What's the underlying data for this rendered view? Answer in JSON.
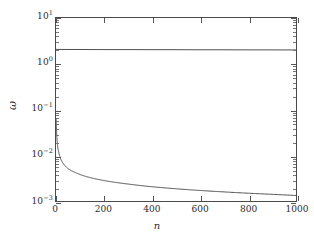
{
  "chart_data": {
    "type": "line",
    "title": "",
    "xlabel": "n",
    "ylabel": "ω",
    "xlim": [
      0,
      1000
    ],
    "ylim": [
      0.001,
      10
    ],
    "yscale": "log",
    "xscale": "linear",
    "grid": false,
    "legend": null,
    "xticks": [
      0,
      200,
      400,
      600,
      800,
      1000
    ],
    "xtick_labels": [
      "0",
      "200",
      "400",
      "600",
      "800",
      "1000"
    ],
    "yticks": [
      10,
      1,
      0.1,
      0.01,
      0.001
    ],
    "ytick_labels": [
      "10¹",
      "10⁰",
      "10⁻¹",
      "10⁻²",
      "10⁻³"
    ],
    "ytick_mantissas": [
      "10",
      "10",
      "10",
      "10",
      "10"
    ],
    "ytick_exponents": [
      "1",
      "0",
      "-1",
      "-2",
      "-3"
    ],
    "series": [
      {
        "name": "upper-constant-branch",
        "style": "solid",
        "color": "#3c3c3c",
        "description": "Nearly constant horizontal branch just above 10^0",
        "x": [
          1,
          50,
          100,
          200,
          300,
          400,
          500,
          600,
          700,
          800,
          900,
          1000
        ],
        "values": [
          2.06,
          2.05,
          2.05,
          2.04,
          2.04,
          2.03,
          2.03,
          2.02,
          2.02,
          2.01,
          2.01,
          2.0
        ]
      },
      {
        "name": "lower-decaying-branch",
        "style": "solid",
        "color": "#3c3c3c",
        "description": "Steeply decaying branch falling from ~6e-2 near n=1 toward ~1.3e-3 at n=1000",
        "x": [
          1,
          2,
          3,
          5,
          8,
          12,
          20,
          30,
          50,
          80,
          120,
          200,
          300,
          400,
          500,
          600,
          700,
          800,
          900,
          1000
        ],
        "values": [
          0.062,
          0.038,
          0.028,
          0.0195,
          0.0142,
          0.0112,
          0.0082,
          0.0066,
          0.0051,
          0.0042,
          0.0035,
          0.0028,
          0.00235,
          0.00205,
          0.00185,
          0.0017,
          0.00158,
          0.00148,
          0.0014,
          0.00132
        ]
      }
    ]
  },
  "axes": {
    "y_title": "ω",
    "x_title": "n"
  },
  "colors": {
    "axis": "#4a4a4a",
    "curve": "#3c3c3c",
    "text": "#2a2a2a",
    "background": "#ffffff"
  }
}
